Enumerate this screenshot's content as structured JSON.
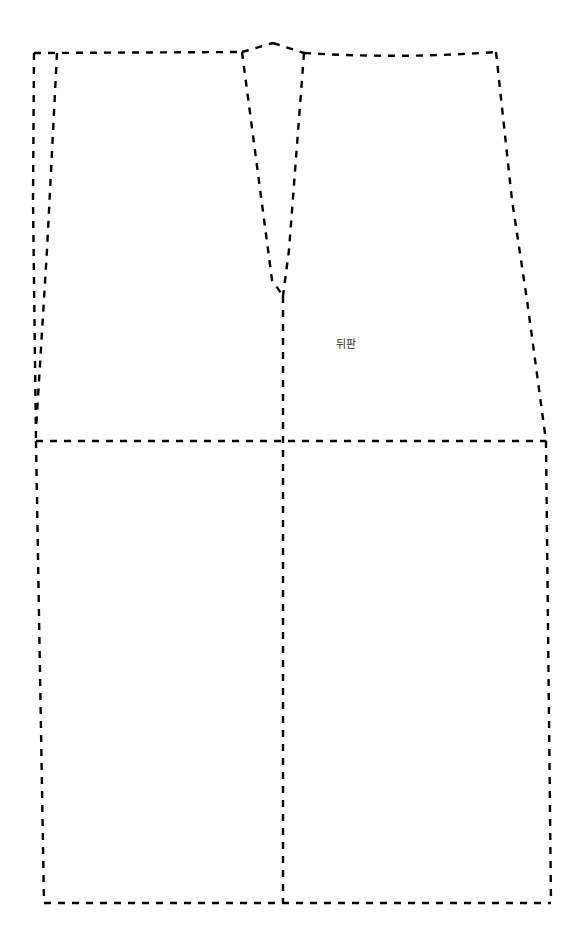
{
  "document": {
    "kind": "sewing-pattern-draft",
    "background_color": "#ffffff",
    "line_color": "#000000",
    "line_style": "dashed",
    "width": 584,
    "height": 938
  },
  "labels": {
    "back_panel": {
      "text": "뒤판",
      "x": 346,
      "y": 344,
      "color": "#2b2b2b",
      "font_size": 11
    }
  },
  "pattern_data": {
    "type": "line-drawing",
    "title": "뒤판",
    "pieces": [
      {
        "name": "skirt-back-outline",
        "description": "Outer cutting line of back skirt panel",
        "points": "34,53 242,52 273,43 304,53 496,52 546,441 551,903 44,903 36,441"
      }
    ],
    "paths": [
      {
        "name": "waistline-left",
        "d": "M 34 53 L 242 52"
      },
      {
        "name": "waistline-dart-peak-left",
        "d": "M 242 52 L 273 43"
      },
      {
        "name": "waistline-dart-peak-right",
        "d": "M 273 43 L 304 53"
      },
      {
        "name": "waistline-right",
        "d": "M 304 53 Q 400 59 496 52"
      },
      {
        "name": "side-seam-left-upper",
        "d": "M 34 53 L 33 200 L 36 441"
      },
      {
        "name": "side-seam-left-lower",
        "d": "M 36 441 L 44 903"
      },
      {
        "name": "seam-allowance-left",
        "d": "M 57 53 L 47 250 L 36 430"
      },
      {
        "name": "side-seam-right-upper",
        "d": "M 496 52 L 512 200 L 527 300 L 546 441"
      },
      {
        "name": "side-seam-right-lower",
        "d": "M 546 441 L 551 903"
      },
      {
        "name": "hemline",
        "d": "M 44 903 L 551 903"
      },
      {
        "name": "hipline",
        "d": "M 36 441 L 546 441"
      },
      {
        "name": "dart-leg-left",
        "d": "M 242 52 L 272 280 L 283 296"
      },
      {
        "name": "dart-leg-right",
        "d": "M 304 53 L 289 250 L 283 296"
      },
      {
        "name": "center-back-line",
        "d": "M 283 296 L 283 903"
      }
    ]
  }
}
